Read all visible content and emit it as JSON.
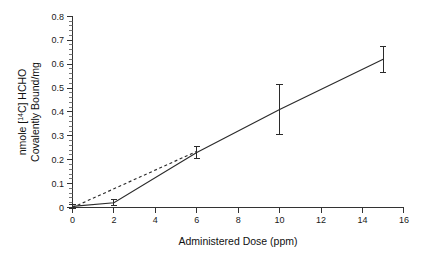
{
  "chart_data": {
    "type": "scatter",
    "title": "",
    "subtitle": "",
    "xlabel": "Administered Dose (ppm)",
    "ylabel_line1": "nmole [14C] HCHO",
    "ylabel_line2": "Covalently Bound/mg",
    "ylabel": "nmole [14C] HCHO Covalently Bound/mg",
    "ylabel_prefix": "nmole [",
    "ylabel_superscript": "14",
    "ylabel_suffix": "C] HCHO",
    "xlim": [
      0,
      16
    ],
    "ylim": [
      0,
      0.8
    ],
    "x_ticks": [
      0,
      2,
      4,
      6,
      8,
      10,
      12,
      14,
      16
    ],
    "x_tick_labels": [
      "0",
      "2",
      "4",
      "6",
      "8",
      "10",
      "12",
      "14",
      "16"
    ],
    "y_ticks": [
      0,
      0.1,
      0.2,
      0.3,
      0.4,
      0.5,
      0.6,
      0.7,
      0.8
    ],
    "y_tick_labels": [
      "0",
      "0.1",
      "0.2",
      "0.3",
      "0.4",
      "0.5",
      "0.6",
      "0.7",
      "0.8"
    ],
    "y_minor_tick_step": 0.02,
    "x_minor_tick_step": 1,
    "grid": false,
    "legend": false,
    "legend_position": "none",
    "series": [
      {
        "name": "Covalent binding (measured)",
        "style": "solid",
        "color": "#2b2b2b",
        "x": [
          0,
          2,
          6,
          10,
          15
        ],
        "values": [
          0.005,
          0.02,
          0.23,
          0.41,
          0.62
        ],
        "yerr": [
          0.008,
          0.012,
          0.025,
          0.105,
          0.055
        ]
      },
      {
        "name": "Linear extrapolation from low dose",
        "style": "dashed",
        "color": "#2b2b2b",
        "x": [
          0,
          6
        ],
        "values": [
          0.0,
          0.235
        ],
        "yerr": [
          0,
          0
        ]
      }
    ],
    "annotations": []
  },
  "figure": {
    "background_color": "#ffffff",
    "axis_color": "#333333",
    "data_color": "#2b2b2b"
  }
}
